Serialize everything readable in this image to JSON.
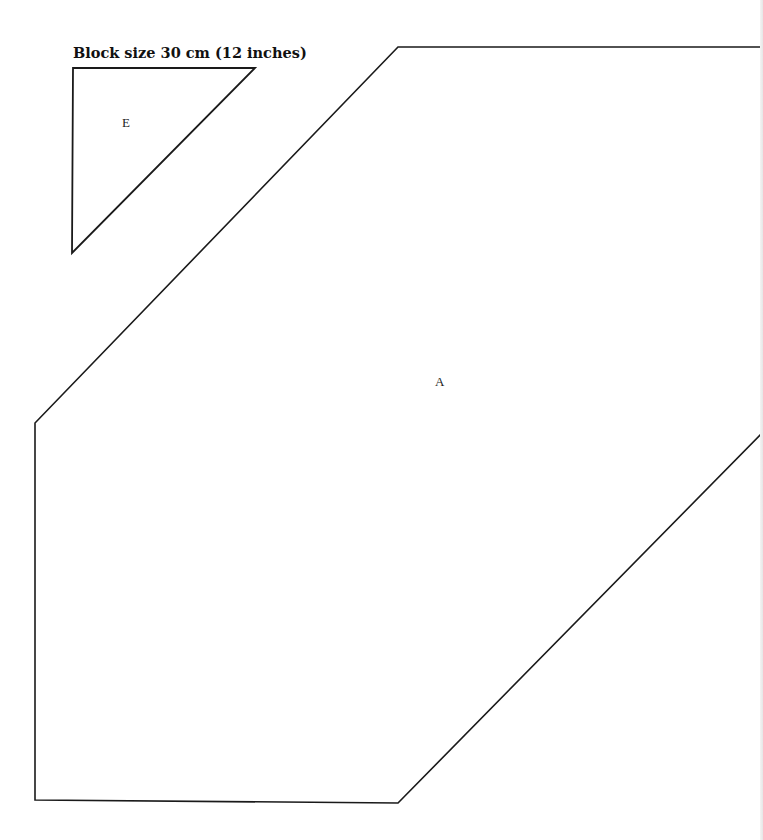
{
  "heading": "Block size 30 cm (12 inches)",
  "pieces": [
    {
      "label": "E",
      "shape": "triangle",
      "points": "73,68 255,68 72,253",
      "label_pos": [
        122,
        115
      ]
    },
    {
      "label": "A",
      "shape": "hexagon",
      "points": "398,47 763,47 763,432 398,803 35,800 35,423",
      "label_pos": [
        435,
        374
      ]
    }
  ],
  "colors": {
    "stroke": "#1a1a1a",
    "background": "#ffffff"
  }
}
